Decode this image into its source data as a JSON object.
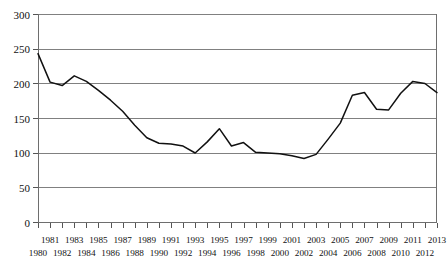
{
  "chart_data": {
    "type": "line",
    "title": "",
    "subtitle": "",
    "xlabel": "",
    "ylabel": "",
    "xlim": [
      1980,
      2013
    ],
    "ylim": [
      0,
      300
    ],
    "grid": true,
    "grid_axis": "y",
    "legend": false,
    "legend_position": "none",
    "y_ticks": [
      0,
      50,
      100,
      150,
      200,
      250,
      300
    ],
    "y_tick_labels": [
      "0",
      "50",
      "100",
      "150",
      "200",
      "250",
      "300"
    ],
    "x_ticks": [
      1980,
      1981,
      1982,
      1983,
      1984,
      1985,
      1986,
      1987,
      1988,
      1989,
      1990,
      1991,
      1992,
      1993,
      1994,
      1995,
      1996,
      1997,
      1998,
      1999,
      2000,
      2001,
      2002,
      2003,
      2004,
      2005,
      2006,
      2007,
      2008,
      2009,
      2010,
      2011,
      2012,
      2013
    ],
    "x_tick_labels_top": [
      "1981",
      "1983",
      "1985",
      "1987",
      "1989",
      "1991",
      "1993",
      "1995",
      "1997",
      "1999",
      "2001",
      "2003",
      "2005",
      "2007",
      "2009",
      "2011",
      "2013"
    ],
    "x_tick_labels_bottom": [
      "1980",
      "1982",
      "1984",
      "1986",
      "1988",
      "1990",
      "1992",
      "1994",
      "1996",
      "1998",
      "2000",
      "2002",
      "2004",
      "2006",
      "2008",
      "2010",
      "2012"
    ],
    "x": [
      1980,
      1981,
      1982,
      1983,
      1984,
      1985,
      1986,
      1987,
      1988,
      1989,
      1990,
      1991,
      1992,
      1993,
      1994,
      1995,
      1996,
      1997,
      1998,
      1999,
      2000,
      2001,
      2002,
      2003,
      2004,
      2005,
      2006,
      2007,
      2008,
      2009,
      2010,
      2011,
      2012,
      2013
    ],
    "values": [
      243,
      202,
      197,
      211,
      203,
      190,
      176,
      160,
      140,
      122,
      114,
      113,
      110,
      100,
      116,
      135,
      110,
      115,
      101,
      100,
      99,
      96,
      92,
      98,
      120,
      143,
      183,
      187,
      163,
      162,
      186,
      203,
      200,
      187
    ],
    "series_name": "",
    "series_color": "#111111",
    "grid_color": "#808080",
    "axis_color": "#6e6e6e",
    "background_color": "#ffffff"
  }
}
